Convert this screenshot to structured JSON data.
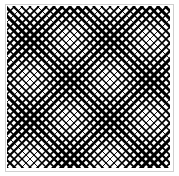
{
  "image": {
    "description": "Crosshatch diagonal line pattern with varying line weights forming diamond moire structures",
    "frame_color": "#cfcfcf",
    "line_color": "#000000",
    "background": "#ffffff",
    "spacing_px": 8,
    "alt": "diagonal crosshatch pattern"
  }
}
